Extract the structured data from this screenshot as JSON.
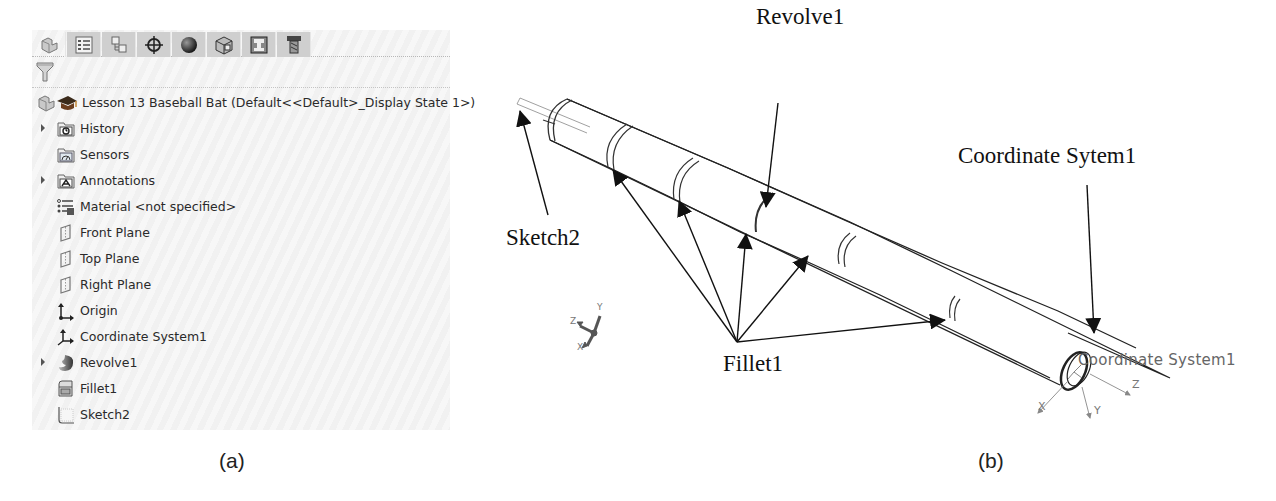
{
  "panel_a": {
    "caption": "(a)",
    "tabs": [
      {
        "name": "feature-manager-tab",
        "icon": "part-icon",
        "active": true
      },
      {
        "name": "property-manager-tab",
        "icon": "property-list-icon",
        "active": false
      },
      {
        "name": "configuration-manager-tab",
        "icon": "configuration-icon",
        "active": false
      },
      {
        "name": "dimxpert-manager-tab",
        "icon": "crosshair-icon",
        "active": false
      },
      {
        "name": "display-manager-tab",
        "icon": "appearance-sphere-icon",
        "active": false
      },
      {
        "name": "cam-feature-tab",
        "icon": "cam-box-icon",
        "active": false
      },
      {
        "name": "cam-operation-tab",
        "icon": "cam-operation-icon",
        "active": false
      },
      {
        "name": "cam-tool-tab",
        "icon": "cam-tool-icon",
        "active": false
      }
    ],
    "filter_icon": "filter-funnel-icon",
    "tree": {
      "root": {
        "label": "Lesson 13 Baseball Bat  (Default<<Default>_Display State 1>)"
      },
      "items": [
        {
          "label": "History",
          "icon": "history-folder-icon",
          "expandable": true
        },
        {
          "label": "Sensors",
          "icon": "sensors-folder-icon",
          "expandable": false
        },
        {
          "label": "Annotations",
          "icon": "annotations-folder-icon",
          "expandable": true
        },
        {
          "label": "Material <not specified>",
          "icon": "material-icon",
          "expandable": false
        },
        {
          "label": "Front Plane",
          "icon": "plane-icon",
          "expandable": false
        },
        {
          "label": "Top Plane",
          "icon": "plane-icon",
          "expandable": false
        },
        {
          "label": "Right Plane",
          "icon": "plane-icon",
          "expandable": false
        },
        {
          "label": "Origin",
          "icon": "origin-icon",
          "expandable": false
        },
        {
          "label": "Coordinate System1",
          "icon": "coordinate-system-icon",
          "expandable": false
        },
        {
          "label": "Revolve1",
          "icon": "revolve-icon",
          "expandable": true
        },
        {
          "label": "Fillet1",
          "icon": "fillet-icon",
          "expandable": false
        },
        {
          "label": "Sketch2",
          "icon": "sketch-icon",
          "expandable": false
        }
      ]
    }
  },
  "panel_b": {
    "caption": "(b)",
    "callouts": {
      "revolve": "Revolve1",
      "sketch": "Sketch2",
      "fillet": "Fillet1",
      "coordinate_system": "Coordinate Sytem1"
    },
    "model_label": "Coordinate System1",
    "triad_axes": {
      "x": "X",
      "y": "Y",
      "z": "Z"
    },
    "cs_axes": {
      "x": "X",
      "y": "Y",
      "z": "Z"
    }
  }
}
